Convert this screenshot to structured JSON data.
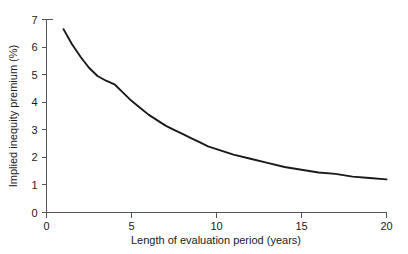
{
  "chart_data": {
    "type": "line",
    "title": "",
    "subtitle": "",
    "xlabel": "Length of evaluation period (years)",
    "ylabel": "Implied inequity premium (%)",
    "xlim": [
      0,
      20
    ],
    "ylim": [
      0,
      7
    ],
    "xticks": [
      0,
      5,
      10,
      15,
      20
    ],
    "xtick_labels": [
      "0",
      "5",
      "10",
      "15",
      "20"
    ],
    "yticks": [
      0,
      1,
      2,
      3,
      4,
      5,
      6,
      7
    ],
    "ytick_labels": [
      "0",
      "1",
      "2",
      "3",
      "4",
      "5",
      "6",
      "7"
    ],
    "grid": false,
    "legend": false,
    "legend_position": "none",
    "line_color": "#1a1a1a",
    "axis_color": "#555555",
    "background_color": "#ffffff",
    "series": [
      {
        "name": "Implied inequity premium",
        "x": [
          1,
          1.5,
          2,
          2.5,
          3,
          3.5,
          4,
          4.5,
          5,
          5.5,
          6,
          6.5,
          7,
          7.5,
          8,
          8.5,
          9,
          9.5,
          10,
          11,
          12,
          13,
          14,
          15,
          16,
          17,
          18,
          19,
          20
        ],
        "values": [
          6.65,
          6.1,
          5.65,
          5.25,
          4.95,
          4.78,
          4.65,
          4.35,
          4.05,
          3.8,
          3.55,
          3.35,
          3.15,
          3.0,
          2.85,
          2.7,
          2.55,
          2.4,
          2.3,
          2.1,
          1.95,
          1.8,
          1.65,
          1.55,
          1.45,
          1.4,
          1.3,
          1.25,
          1.2
        ]
      }
    ]
  },
  "axes": {
    "ylabel": "Implied inequity premium (%)",
    "xlabel": "Length of evaluation period (years)"
  }
}
